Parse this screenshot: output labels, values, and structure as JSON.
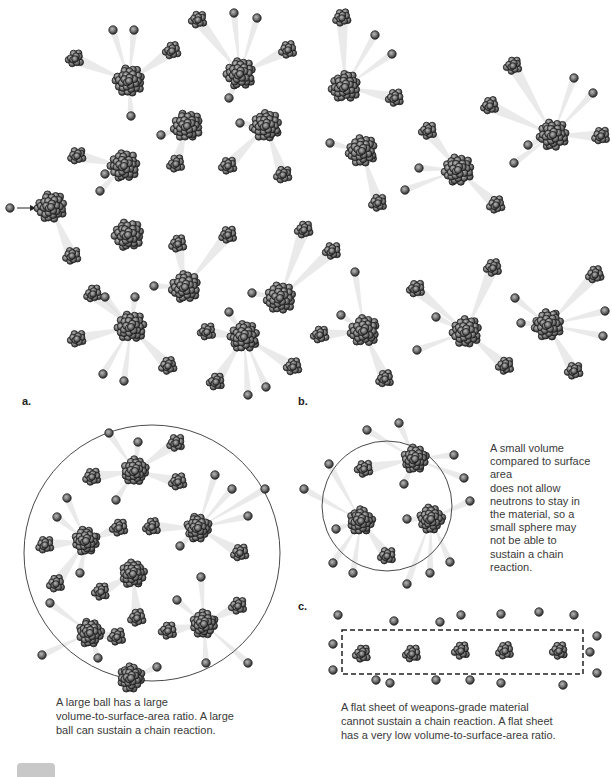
{
  "figure": {
    "colors": {
      "nucleon_dark": "#2e2e2e",
      "nucleon_light": "#9a9a9a",
      "outline": "#4a4a4a",
      "trail": "#d9d9d9",
      "background": "#ffffff"
    }
  },
  "chain_reaction": {
    "incoming_neutron": {
      "x": 10,
      "y": 208
    },
    "arrow": {
      "x1": 17,
      "y1": 208,
      "x2": 35,
      "y2": 208
    },
    "nuclei": [
      {
        "x": 51,
        "y": 207,
        "r": 17
      },
      {
        "x": 129,
        "y": 81,
        "r": 17
      },
      {
        "x": 240,
        "y": 74,
        "r": 17
      },
      {
        "x": 124,
        "y": 166,
        "r": 17
      },
      {
        "x": 187,
        "y": 126,
        "r": 17
      },
      {
        "x": 266,
        "y": 126,
        "r": 17
      },
      {
        "x": 345,
        "y": 87,
        "r": 17
      },
      {
        "x": 362,
        "y": 151,
        "r": 17
      },
      {
        "x": 458,
        "y": 170,
        "r": 17
      },
      {
        "x": 553,
        "y": 135,
        "r": 17
      },
      {
        "x": 128,
        "y": 235,
        "r": 17
      },
      {
        "x": 185,
        "y": 287,
        "r": 17
      },
      {
        "x": 280,
        "y": 298,
        "r": 17
      },
      {
        "x": 131,
        "y": 327,
        "r": 17
      },
      {
        "x": 244,
        "y": 337,
        "r": 17
      },
      {
        "x": 364,
        "y": 331,
        "r": 17
      },
      {
        "x": 466,
        "y": 332,
        "r": 17
      },
      {
        "x": 548,
        "y": 325,
        "r": 17
      }
    ],
    "fragments": [
      {
        "x": 75,
        "y": 59
      },
      {
        "x": 172,
        "y": 51
      },
      {
        "x": 198,
        "y": 20
      },
      {
        "x": 288,
        "y": 50
      },
      {
        "x": 342,
        "y": 18
      },
      {
        "x": 395,
        "y": 98
      },
      {
        "x": 513,
        "y": 66
      },
      {
        "x": 601,
        "y": 136
      },
      {
        "x": 490,
        "y": 106
      },
      {
        "x": 428,
        "y": 131
      },
      {
        "x": 378,
        "y": 203
      },
      {
        "x": 496,
        "y": 205
      },
      {
        "x": 77,
        "y": 156
      },
      {
        "x": 176,
        "y": 164
      },
      {
        "x": 228,
        "y": 166
      },
      {
        "x": 283,
        "y": 175
      },
      {
        "x": 304,
        "y": 230
      },
      {
        "x": 72,
        "y": 256
      },
      {
        "x": 178,
        "y": 244
      },
      {
        "x": 228,
        "y": 235
      },
      {
        "x": 93,
        "y": 294
      },
      {
        "x": 207,
        "y": 332
      },
      {
        "x": 216,
        "y": 382
      },
      {
        "x": 77,
        "y": 339
      },
      {
        "x": 168,
        "y": 366
      },
      {
        "x": 293,
        "y": 367
      },
      {
        "x": 332,
        "y": 251
      },
      {
        "x": 416,
        "y": 289
      },
      {
        "x": 493,
        "y": 268
      },
      {
        "x": 595,
        "y": 275
      },
      {
        "x": 385,
        "y": 379
      },
      {
        "x": 505,
        "y": 366
      },
      {
        "x": 574,
        "y": 371
      },
      {
        "x": 320,
        "y": 335
      }
    ],
    "neutrons": [
      {
        "x": 113,
        "y": 30
      },
      {
        "x": 134,
        "y": 30
      },
      {
        "x": 234,
        "y": 13
      },
      {
        "x": 257,
        "y": 18
      },
      {
        "x": 375,
        "y": 35
      },
      {
        "x": 392,
        "y": 54
      },
      {
        "x": 574,
        "y": 78
      },
      {
        "x": 593,
        "y": 93
      },
      {
        "x": 131,
        "y": 116
      },
      {
        "x": 161,
        "y": 135
      },
      {
        "x": 229,
        "y": 98
      },
      {
        "x": 240,
        "y": 123
      },
      {
        "x": 100,
        "y": 191
      },
      {
        "x": 105,
        "y": 174
      },
      {
        "x": 330,
        "y": 143
      },
      {
        "x": 419,
        "y": 168
      },
      {
        "x": 405,
        "y": 190
      },
      {
        "x": 514,
        "y": 163
      },
      {
        "x": 528,
        "y": 145
      },
      {
        "x": 105,
        "y": 297
      },
      {
        "x": 154,
        "y": 286
      },
      {
        "x": 135,
        "y": 297
      },
      {
        "x": 252,
        "y": 293
      },
      {
        "x": 229,
        "y": 312
      },
      {
        "x": 103,
        "y": 374
      },
      {
        "x": 124,
        "y": 381
      },
      {
        "x": 248,
        "y": 395
      },
      {
        "x": 266,
        "y": 387
      },
      {
        "x": 355,
        "y": 272
      },
      {
        "x": 341,
        "y": 315
      },
      {
        "x": 436,
        "y": 317
      },
      {
        "x": 417,
        "y": 350
      },
      {
        "x": 515,
        "y": 298
      },
      {
        "x": 521,
        "y": 323
      },
      {
        "x": 605,
        "y": 311
      },
      {
        "x": 603,
        "y": 336
      }
    ]
  },
  "panels": {
    "a": {
      "label": "a.",
      "caption_lines": [
        "A large ball has a large",
        "volume-to-surface-area ratio. A large",
        "ball can sustain a chain reaction."
      ]
    },
    "b": {
      "label": "b.",
      "caption_lines": [
        "A small volume",
        "compared to surface area",
        "does not allow",
        "neutrons to stay in",
        "the material, so a",
        "small sphere may",
        "not be able to",
        "sustain a chain",
        "reaction."
      ]
    },
    "c": {
      "label": "c.",
      "caption_lines": [
        "A flat sheet of weapons-grade material",
        "cannot sustain a chain reaction. A flat sheet",
        "has a very low volume-to-surface-area ratio."
      ]
    }
  },
  "large_sphere": {
    "cx": 152,
    "cy": 553,
    "r": 128,
    "nuclei": [
      {
        "x": 135,
        "y": 471,
        "r": 15
      },
      {
        "x": 86,
        "y": 541,
        "r": 15
      },
      {
        "x": 198,
        "y": 528,
        "r": 15
      },
      {
        "x": 133,
        "y": 574,
        "r": 15
      },
      {
        "x": 90,
        "y": 633,
        "r": 15
      },
      {
        "x": 204,
        "y": 624,
        "r": 15
      },
      {
        "x": 131,
        "y": 678,
        "r": 15
      }
    ],
    "fragments": [
      {
        "x": 176,
        "y": 443
      },
      {
        "x": 92,
        "y": 477
      },
      {
        "x": 178,
        "y": 482
      },
      {
        "x": 119,
        "y": 528
      },
      {
        "x": 152,
        "y": 527
      },
      {
        "x": 45,
        "y": 545
      },
      {
        "x": 240,
        "y": 553
      },
      {
        "x": 56,
        "y": 584
      },
      {
        "x": 101,
        "y": 592
      },
      {
        "x": 137,
        "y": 618
      },
      {
        "x": 168,
        "y": 631
      },
      {
        "x": 117,
        "y": 637
      },
      {
        "x": 238,
        "y": 606
      }
    ],
    "neutrons": [
      {
        "x": 109,
        "y": 433
      },
      {
        "x": 138,
        "y": 442
      },
      {
        "x": 215,
        "y": 475
      },
      {
        "x": 232,
        "y": 489
      },
      {
        "x": 265,
        "y": 489
      },
      {
        "x": 67,
        "y": 498
      },
      {
        "x": 116,
        "y": 500
      },
      {
        "x": 57,
        "y": 517
      },
      {
        "x": 248,
        "y": 516
      },
      {
        "x": 180,
        "y": 546
      },
      {
        "x": 80,
        "y": 573
      },
      {
        "x": 201,
        "y": 577
      },
      {
        "x": 50,
        "y": 603
      },
      {
        "x": 177,
        "y": 600
      },
      {
        "x": 42,
        "y": 655
      },
      {
        "x": 98,
        "y": 658
      },
      {
        "x": 157,
        "y": 667
      },
      {
        "x": 206,
        "y": 663
      },
      {
        "x": 248,
        "y": 663
      }
    ]
  },
  "small_sphere": {
    "cx": 387,
    "cy": 506,
    "r": 65,
    "nuclei": [
      {
        "x": 415,
        "y": 459,
        "r": 15
      },
      {
        "x": 361,
        "y": 521,
        "r": 15
      },
      {
        "x": 431,
        "y": 519,
        "r": 15
      }
    ],
    "fragments": [
      {
        "x": 364,
        "y": 469
      },
      {
        "x": 387,
        "y": 556
      }
    ],
    "neutrons": [
      {
        "x": 399,
        "y": 423
      },
      {
        "x": 367,
        "y": 430
      },
      {
        "x": 329,
        "y": 464
      },
      {
        "x": 454,
        "y": 455
      },
      {
        "x": 304,
        "y": 489
      },
      {
        "x": 464,
        "y": 478
      },
      {
        "x": 404,
        "y": 484
      },
      {
        "x": 470,
        "y": 501
      },
      {
        "x": 407,
        "y": 519
      },
      {
        "x": 336,
        "y": 529
      },
      {
        "x": 333,
        "y": 563
      },
      {
        "x": 450,
        "y": 562
      },
      {
        "x": 353,
        "y": 573
      },
      {
        "x": 430,
        "y": 573
      },
      {
        "x": 407,
        "y": 584
      }
    ]
  },
  "flat_sheet": {
    "rect": {
      "x": 342,
      "y": 630,
      "w": 241,
      "h": 44
    },
    "fragments": [
      {
        "x": 362,
        "y": 654
      },
      {
        "x": 412,
        "y": 654
      },
      {
        "x": 461,
        "y": 651
      },
      {
        "x": 505,
        "y": 651
      },
      {
        "x": 559,
        "y": 651
      }
    ],
    "neutrons": [
      {
        "x": 338,
        "y": 615
      },
      {
        "x": 394,
        "y": 621
      },
      {
        "x": 440,
        "y": 622
      },
      {
        "x": 461,
        "y": 615
      },
      {
        "x": 501,
        "y": 614
      },
      {
        "x": 539,
        "y": 612
      },
      {
        "x": 574,
        "y": 615
      },
      {
        "x": 333,
        "y": 644
      },
      {
        "x": 333,
        "y": 670
      },
      {
        "x": 597,
        "y": 636
      },
      {
        "x": 590,
        "y": 652
      },
      {
        "x": 597,
        "y": 673
      },
      {
        "x": 376,
        "y": 680
      },
      {
        "x": 390,
        "y": 683
      },
      {
        "x": 436,
        "y": 680
      },
      {
        "x": 470,
        "y": 680
      },
      {
        "x": 501,
        "y": 683
      },
      {
        "x": 563,
        "y": 685
      }
    ]
  }
}
